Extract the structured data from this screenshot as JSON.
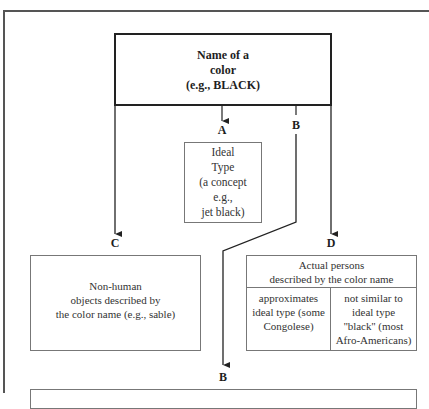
{
  "diagram": {
    "main_box": {
      "lines": [
        "Name of a",
        "color",
        "(e.g., BLACK)"
      ]
    },
    "branches": {
      "A": {
        "label": "A",
        "lines": [
          "Ideal",
          "Type",
          "(a concept",
          "e.g.,",
          "jet black)"
        ]
      },
      "B_top": {
        "label": "B"
      },
      "C": {
        "label": "C",
        "lines": [
          "Non-human",
          "objects described by",
          "the color name (e.g., sable)"
        ]
      },
      "D": {
        "label": "D",
        "header_lines": [
          "Actual persons",
          "described by the color name"
        ],
        "left_col_lines": [
          "approximates",
          "ideal type (some",
          "Congolese)"
        ],
        "right_col_lines": [
          "not similar to",
          "ideal type",
          "''black'' (most",
          "Afro-Americans)"
        ]
      },
      "B_bottom": {
        "label": "B"
      }
    },
    "colors": {
      "line": "#222222",
      "box_border": "#777777",
      "frame": "#555555",
      "background": "#ffffff"
    }
  }
}
